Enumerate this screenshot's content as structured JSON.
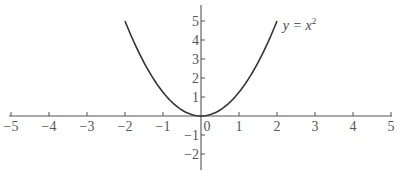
{
  "chart_data": {
    "type": "line",
    "title": "",
    "xlabel": "",
    "ylabel": "",
    "function": "y = x^2",
    "annotation": {
      "text": "y = x",
      "superscript": "2",
      "position": [
        2.1,
        4.8
      ]
    },
    "xlim": [
      -5,
      5
    ],
    "ylim": [
      -2.5,
      5.8
    ],
    "grid": false,
    "legend": "none",
    "x_ticks": [
      -5,
      -4,
      -3,
      -2,
      -1,
      0,
      1,
      2,
      3,
      4,
      5
    ],
    "x_tick_labels": [
      "−5",
      "−4",
      "−3",
      "−2",
      "−1",
      "0",
      "1",
      "2",
      "3",
      "4",
      "5"
    ],
    "y_ticks": [
      -2,
      -1,
      1,
      2,
      3,
      4,
      5
    ],
    "y_tick_labels": [
      "−2",
      "−1",
      "1",
      "2",
      "3",
      "4",
      "5"
    ],
    "series": [
      {
        "name": "y = x^2",
        "domain": [
          -2,
          2
        ],
        "x": [
          -2,
          -1.5,
          -1,
          -0.5,
          0,
          0.5,
          1,
          1.5,
          2
        ],
        "y": [
          4,
          2.25,
          1,
          0.25,
          0,
          0.25,
          1,
          2.25,
          4
        ]
      }
    ]
  },
  "layout": {
    "origin_px": [
      201,
      116
    ],
    "x_unit_px": 38,
    "y_unit_px": 19,
    "y_axis_top_px": 5,
    "y_axis_bottom_px": 170,
    "x_axis_left_px": 9,
    "x_axis_right_px": 392
  }
}
